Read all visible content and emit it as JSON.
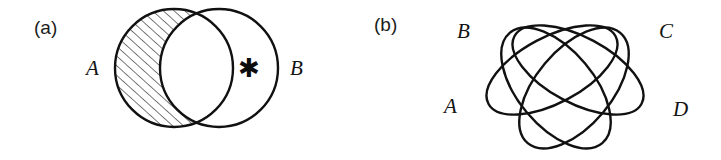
{
  "figure": {
    "caption_a": "(a)",
    "caption_b": "(b)",
    "stroke_color": "#111111",
    "hatch_color": "#2b2b2b",
    "background_color": "#ffffff"
  },
  "panel_a": {
    "tag": "(a)",
    "type": "venn-2-set",
    "labels": {
      "left_set": "A",
      "right_set": "B"
    },
    "marker": {
      "glyph": "✱",
      "name": "asterisk-marker",
      "region": "B-only"
    },
    "shaded_region": "A-minus-B",
    "shading_style": "diagonal-hatch",
    "circles": [
      {
        "name": "A",
        "cx": 174,
        "cy": 68,
        "r": 59
      },
      {
        "name": "B",
        "cx": 219,
        "cy": 68,
        "r": 59
      }
    ]
  },
  "panel_b": {
    "tag": "(b)",
    "type": "venn-4-set",
    "labels": {
      "set_1": "A",
      "set_2": "B",
      "set_3": "C",
      "set_4": "D"
    },
    "ellipses": [
      {
        "name": "A",
        "cx": 556,
        "cy": 88,
        "rx": 72,
        "ry": 38,
        "rotate": 50
      },
      {
        "name": "B",
        "cx": 578,
        "cy": 70,
        "rx": 72,
        "ry": 33,
        "rotate": 28
      },
      {
        "name": "C",
        "cx": 552,
        "cy": 70,
        "rx": 72,
        "ry": 33,
        "rotate": -28
      },
      {
        "name": "D",
        "cx": 574,
        "cy": 88,
        "rx": 72,
        "ry": 38,
        "rotate": -50
      }
    ]
  }
}
